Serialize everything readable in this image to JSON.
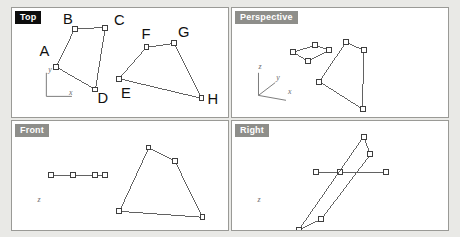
{
  "app": {
    "background_color": "#e9e9e6",
    "viewport_border_color": "#9a9a96",
    "active_label_bg": "#0d0d0d",
    "inactive_label_bg": "#8e8e8a",
    "edge_color": "#5f5f5f",
    "vertex_fill": "#ffffff"
  },
  "viewports": {
    "top": {
      "label": "Top",
      "active": true,
      "axes": {
        "origin": [
          34,
          90
        ],
        "labels": [
          {
            "text": "y",
            "x": 36,
            "y": 65
          },
          {
            "text": "x",
            "x": 57,
            "y": 89
          }
        ]
      },
      "shapes": [
        {
          "name": "quad-abcd",
          "points": [
            [
              44,
              60
            ],
            [
              63,
              21
            ],
            [
              94,
              20
            ],
            [
              84,
              83
            ]
          ],
          "closed": true,
          "vertex_labels": [
            {
              "text": "A",
              "x": 27,
              "y": 49
            },
            {
              "text": "B",
              "x": 51,
              "y": 16
            },
            {
              "text": "C",
              "x": 103,
              "y": 17
            },
            {
              "text": "D",
              "x": 86,
              "y": 97
            }
          ]
        },
        {
          "name": "quad-efgh",
          "points": [
            [
              108,
              72
            ],
            [
              136,
              40
            ],
            [
              164,
              36
            ],
            [
              192,
              92
            ]
          ],
          "closed": true,
          "vertex_labels": [
            {
              "text": "E",
              "x": 110,
              "y": 92
            },
            {
              "text": "F",
              "x": 131,
              "y": 32
            },
            {
              "text": "G",
              "x": 168,
              "y": 30
            },
            {
              "text": "H",
              "x": 198,
              "y": 98
            }
          ]
        }
      ]
    },
    "perspective": {
      "label": "Perspective",
      "active": false,
      "axes": {
        "origin": [
          26,
          89
        ],
        "labels": [
          {
            "text": "z",
            "x": 26,
            "y": 62
          },
          {
            "text": "y",
            "x": 44,
            "y": 73
          },
          {
            "text": "x",
            "x": 56,
            "y": 88
          }
        ]
      },
      "shapes": [
        {
          "name": "quad-small",
          "points": [
            [
              61,
              45
            ],
            [
              84,
              38
            ],
            [
              98,
              43
            ],
            [
              76,
              54
            ]
          ],
          "closed": true,
          "vertex_labels": []
        },
        {
          "name": "quad-large",
          "points": [
            [
              115,
              35
            ],
            [
              133,
              43
            ],
            [
              132,
              103
            ],
            [
              88,
              75
            ]
          ],
          "closed": true,
          "vertex_labels": []
        }
      ]
    },
    "front": {
      "label": "Front",
      "active": false,
      "axes": {
        "origin": [
          24,
          148
        ],
        "labels": [
          {
            "text": "z",
            "x": 25,
            "y": 82
          },
          {
            "text": "x",
            "x": 48,
            "y": 147
          }
        ]
      },
      "shapes": [
        {
          "name": "degenerate-line",
          "points": [
            [
              39,
              55
            ],
            [
              61,
              55
            ],
            [
              84,
              55
            ],
            [
              94,
              55
            ]
          ],
          "closed": false,
          "vertex_labels": []
        },
        {
          "name": "quad-front",
          "points": [
            [
              138,
              27
            ],
            [
              165,
              41
            ],
            [
              193,
              98
            ],
            [
              108,
              92
            ]
          ],
          "closed": true,
          "vertex_labels": []
        }
      ]
    },
    "right": {
      "label": "Right",
      "active": false,
      "axes": {
        "origin": [
          24,
          148
        ],
        "labels": [
          {
            "text": "z",
            "x": 25,
            "y": 82
          },
          {
            "text": "y",
            "x": 50,
            "y": 147
          }
        ]
      },
      "shapes": [
        {
          "name": "degenerate-line",
          "points": [
            [
              85,
              52
            ],
            [
              109,
              52
            ],
            [
              156,
              52
            ]
          ],
          "closed": false,
          "vertex_labels": []
        },
        {
          "name": "quad-right",
          "points": [
            [
              133,
              16
            ],
            [
              140,
              34
            ],
            [
              90,
              100
            ],
            [
              67,
              111
            ]
          ],
          "closed": true,
          "vertex_labels": []
        }
      ]
    }
  }
}
